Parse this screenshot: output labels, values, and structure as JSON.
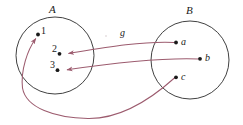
{
  "figure": {
    "background_color": "#ffffff",
    "circle_stroke_color": "#2b2b2b",
    "arrow_color": "#9c5b6e",
    "dot_color": "#1a1a1a",
    "text_color": "#1a1a1a"
  },
  "sets": {
    "left": {
      "name": "A",
      "label": "A",
      "elements": [
        {
          "id": "1",
          "label": "1"
        },
        {
          "id": "2",
          "label": "2"
        },
        {
          "id": "3",
          "label": "3"
        }
      ]
    },
    "right": {
      "name": "B",
      "label": "B",
      "elements": [
        {
          "id": "a",
          "label": "a"
        },
        {
          "id": "b",
          "label": "b"
        },
        {
          "id": "c",
          "label": "c"
        }
      ]
    }
  },
  "mapping": {
    "name_label": "g",
    "direction": "B-to-A",
    "arrows": [
      {
        "from": "a",
        "to": "2"
      },
      {
        "from": "b",
        "to": "3"
      },
      {
        "from": "c",
        "to": "1"
      }
    ]
  }
}
